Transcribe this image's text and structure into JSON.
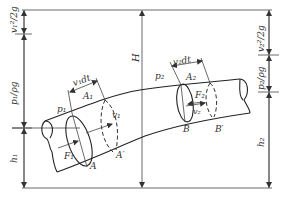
{
  "diagram": {
    "labels": {
      "v1_head": "v₁²/2g",
      "p1_head": "p₁/ρg",
      "h1": "h₁",
      "H": "H",
      "v2_head": "v₂²/2g",
      "p2_head": "p₂/ρg",
      "h2": "h₂",
      "v1dt": "v₁dt",
      "v2dt": "v₂dt",
      "A1": "A₁",
      "A2": "A₂",
      "p1": "p₁",
      "p2": "p₂",
      "v1": "v₁",
      "v2": "v₂",
      "F1": "F₁",
      "F2": "F₂",
      "A": "A",
      "A_prime": "A′",
      "B": "B",
      "B_prime": "B′"
    },
    "colors": {
      "stroke": "#333333",
      "background": "#ffffff"
    }
  }
}
